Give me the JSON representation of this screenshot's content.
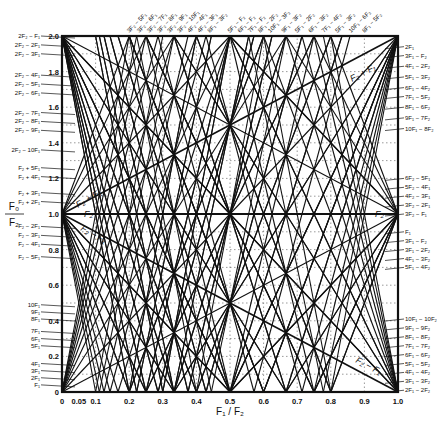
{
  "chart_data": {
    "type": "line",
    "title": "",
    "xlabel": "F1 / F2",
    "ylabel": "F0 / F2",
    "xlim": [
      0,
      1.0
    ],
    "ylim": [
      0,
      2.0
    ],
    "grid": true,
    "x_ticks": [
      "0",
      "0.05",
      "0.1",
      "0.2",
      "0.3",
      "0.4",
      "0.5",
      "0.6",
      "0.7",
      "0.8",
      "0.9",
      "1.0"
    ],
    "x_tick_values": [
      0,
      0.05,
      0.1,
      0.2,
      0.3,
      0.4,
      0.5,
      0.6,
      0.7,
      0.8,
      0.9,
      1.0
    ],
    "y_ticks": [
      "0",
      "0.2",
      "0.4",
      "0.6",
      "0.8",
      "1.0",
      "1.2",
      "1.4",
      "1.6",
      "1.8",
      "2.0"
    ],
    "y_tick_values": [
      0,
      0.2,
      0.4,
      0.6,
      0.8,
      1.0,
      1.2,
      1.4,
      1.6,
      1.8,
      2.0
    ],
    "series_families": [
      {
        "name": "mF1",
        "formula": "m*x",
        "m": [
          1,
          2,
          3,
          4,
          5,
          6,
          7,
          8,
          9,
          10
        ]
      },
      {
        "name": "F2",
        "formula": "1"
      },
      {
        "name": "F2 + F1",
        "formula": "1 + x"
      },
      {
        "name": "F2 - F1",
        "formula": "|1 - x|"
      },
      {
        "name": "F2 + mF1",
        "formula": "1 + m*x",
        "m": [
          2,
          3,
          4,
          5
        ]
      },
      {
        "name": "F2 - mF1",
        "formula": "|1 - m*x|",
        "m": [
          2,
          3,
          4,
          5
        ]
      },
      {
        "name": "2F2 - mF1",
        "formula": "|2 - m*x|",
        "m": [
          1,
          2,
          3,
          4,
          5,
          6,
          7,
          8,
          9,
          10
        ]
      },
      {
        "name": "3F2 - mF1",
        "formula": "|3 - m*x|",
        "m": [
          2,
          3,
          4,
          5,
          6,
          7,
          8,
          9,
          10
        ]
      },
      {
        "name": "mF1 - mF2",
        "formula": "|m*x - m|",
        "m": [
          2,
          3,
          4,
          5,
          6,
          7,
          8,
          9,
          10
        ]
      },
      {
        "name": "mF1 - (m-2)F2",
        "formula": "m*x - (m-2)",
        "m": [
          2,
          3,
          4,
          5,
          6,
          7,
          8,
          9,
          10
        ]
      },
      {
        "name": "(m+1)F2 - mF1",
        "formula": "|(m+1) - m*x|",
        "m": [
          1,
          2,
          3,
          4,
          5
        ]
      },
      {
        "name": "mF1 - (m-1)F2",
        "formula": "|m*x - (m-1)|",
        "m": [
          2,
          3,
          4,
          5
        ]
      }
    ]
  },
  "axes": {
    "x_title": "F₁ / F₂",
    "y_title_num": "F₀",
    "y_title_den": "F₂"
  },
  "left_labels": [
    {
      "text": "2F₂ − F₁",
      "y": 2.0
    },
    {
      "text": "2F₂ − 2F₁",
      "y": 1.95
    },
    {
      "text": "2F₂ − 3F₁",
      "y": 1.9
    },
    {
      "text": "2F₂ − 4F₁",
      "y": 1.78
    },
    {
      "text": "2F₂ − 5F₁",
      "y": 1.73
    },
    {
      "text": "2F₂ − 6F₁",
      "y": 1.68
    },
    {
      "text": "2F₂ − 7F₁",
      "y": 1.57
    },
    {
      "text": "2F₂ − 8F₁",
      "y": 1.52
    },
    {
      "text": "2F₂ − 9F₁",
      "y": 1.47
    },
    {
      "text": "2F₂ − 10F₁",
      "y": 1.36
    },
    {
      "text": "F₂ + 5F₁",
      "y": 1.26
    },
    {
      "text": "F₂ + 4F₁",
      "y": 1.21
    },
    {
      "text": "F₂ + 3F₁",
      "y": 1.12
    },
    {
      "text": "F₂ + 2F₁",
      "y": 1.07
    },
    {
      "text": "F₂ − 2F₁",
      "y": 0.93
    },
    {
      "text": "F₂ − 3F₁",
      "y": 0.88
    },
    {
      "text": "F₂ − 4F₁",
      "y": 0.83
    },
    {
      "text": "F₂ − 5F₁",
      "y": 0.76
    },
    {
      "text": "10F₁",
      "y": 0.49
    },
    {
      "text": "9F₁",
      "y": 0.45
    },
    {
      "text": "8F₁",
      "y": 0.41
    },
    {
      "text": "7F₁",
      "y": 0.34
    },
    {
      "text": "6F₁",
      "y": 0.3
    },
    {
      "text": "5F₁",
      "y": 0.26
    },
    {
      "text": "4F₁",
      "y": 0.16
    },
    {
      "text": "3F₁",
      "y": 0.12
    },
    {
      "text": "2F₁",
      "y": 0.08
    },
    {
      "text": "F₁",
      "y": 0.04
    }
  ],
  "right_labels": [
    {
      "text": "2F₁",
      "y": 1.94
    },
    {
      "text": "3F₁ − F₂",
      "y": 1.89
    },
    {
      "text": "4F₁ − 2F₂",
      "y": 1.83
    },
    {
      "text": "5F₁ − 3F₂",
      "y": 1.77
    },
    {
      "text": "6F₁ − 4F₂",
      "y": 1.71
    },
    {
      "text": "7F₁ − 5F₂",
      "y": 1.66
    },
    {
      "text": "8F₁ − 6F₂",
      "y": 1.6
    },
    {
      "text": "9F₁ − 7F₂",
      "y": 1.54
    },
    {
      "text": "10F₁ − 8F₂",
      "y": 1.48
    },
    {
      "text": "6F₂ − 5F₁",
      "y": 1.2
    },
    {
      "text": "5F₂ − 4F₁",
      "y": 1.15
    },
    {
      "text": "4F₂ − 3F₁",
      "y": 1.1
    },
    {
      "text": "3F₂ − 2F₁",
      "y": 1.05
    },
    {
      "text": "3F₂ − F₁",
      "y": 1.0
    },
    {
      "text": "F₁",
      "y": 0.9
    },
    {
      "text": "3F₁ − F₂",
      "y": 0.85
    },
    {
      "text": "3F₁ − 2F₂",
      "y": 0.8
    },
    {
      "text": "4F₁ − 3F₂",
      "y": 0.75
    },
    {
      "text": "5F₁ − 4F₂",
      "y": 0.7
    },
    {
      "text": "10F₁ − 10F₂",
      "y": 0.41
    },
    {
      "text": "9F₁ − 9F₂",
      "y": 0.36
    },
    {
      "text": "8F₁ − 8F₂",
      "y": 0.31
    },
    {
      "text": "7F₁ − 7F₂",
      "y": 0.26
    },
    {
      "text": "6F₁ − 6F₂",
      "y": 0.21
    },
    {
      "text": "5F₁ − 5F₂",
      "y": 0.16
    },
    {
      "text": "4F₁ − 4F₂",
      "y": 0.11
    },
    {
      "text": "3F₁ − 3F₂",
      "y": 0.06
    },
    {
      "text": "2F₁ − 2F₂",
      "y": 0.01
    }
  ],
  "top_labels": [
    {
      "text": "3F₂ − 5F₁",
      "x": 0.2
    },
    {
      "text": "3F₂ − 6F₁",
      "x": 0.23
    },
    {
      "text": "3F₂ − 7F₁",
      "x": 0.26
    },
    {
      "text": "3F₂ − 8F₁",
      "x": 0.29
    },
    {
      "text": "3F₂ − 9F₁",
      "x": 0.32
    },
    {
      "text": "3F₂ − 10F₁",
      "x": 0.35
    },
    {
      "text": "4F₂ − 4F₁",
      "x": 0.38
    },
    {
      "text": "4F₂ − 3F₁",
      "x": 0.41
    },
    {
      "text": "8F₁ − 3F₂",
      "x": 0.44
    },
    {
      "text": "5F₁ − F₂",
      "x": 0.5
    },
    {
      "text": "6F₁ − F₂",
      "x": 0.53
    },
    {
      "text": "7F₁ − F₂",
      "x": 0.56
    },
    {
      "text": "8F₁ − 2F₂",
      "x": 0.59
    },
    {
      "text": "10F₁ − 3F₂",
      "x": 0.62
    },
    {
      "text": "9F₁ − 3F₂",
      "x": 0.66
    },
    {
      "text": "5F₁ − 2F₂",
      "x": 0.7
    },
    {
      "text": "6F₁ − 3F₂",
      "x": 0.74
    },
    {
      "text": "7F₁ − 4F₂",
      "x": 0.78
    },
    {
      "text": "5F₁ − 3F₂",
      "x": 0.82
    },
    {
      "text": "10F₁ − 6F₂",
      "x": 0.86
    },
    {
      "text": "8F₁ − 5F₂",
      "x": 0.9
    }
  ],
  "annotations": {
    "f2_plus_f1": "F₂ + F₁",
    "f2_minus_f1": "F₂ − F₁",
    "f2_left": "F₂",
    "f2_right": "F₂",
    "f2_plus_f1_left": "F₂ + F₁",
    "f2_minus_f1_left": "F₂ − F₁"
  },
  "colors": {
    "line": "#111111",
    "grid": "#555555",
    "background": "#ffffff"
  }
}
